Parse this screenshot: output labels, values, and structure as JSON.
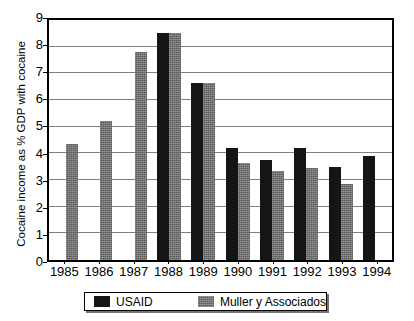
{
  "chart_data": {
    "type": "bar",
    "title": "",
    "xlabel": "",
    "ylabel": "Cocaine income as % GDP with cocaine",
    "categories": [
      "1985",
      "1986",
      "1987",
      "1988",
      "1989",
      "1990",
      "1991",
      "1992",
      "1993",
      "1994"
    ],
    "ylim": [
      0,
      9
    ],
    "yticks": [
      0,
      1,
      2,
      3,
      4,
      5,
      6,
      7,
      8,
      9
    ],
    "ytick_labels": [
      "0",
      "1",
      "2",
      "3",
      "4",
      "5",
      "6",
      "7",
      "8",
      "9"
    ],
    "grid": true,
    "legend_position": "bottom",
    "series": [
      {
        "name": "USAID",
        "color": "#151515",
        "values": [
          null,
          null,
          null,
          8.5,
          6.65,
          4.2,
          3.75,
          4.2,
          3.5,
          3.9
        ]
      },
      {
        "name": "Muller y Associados",
        "color": "#6e6e6e",
        "values": [
          4.35,
          5.2,
          7.8,
          8.5,
          6.65,
          3.65,
          3.35,
          3.45,
          2.85,
          null
        ]
      }
    ]
  },
  "legend": {
    "items": [
      {
        "label": "USAID",
        "swatch": "usaid"
      },
      {
        "label": "Muller y Associados",
        "swatch": "muller"
      }
    ]
  },
  "caption": {
    "text": ""
  }
}
